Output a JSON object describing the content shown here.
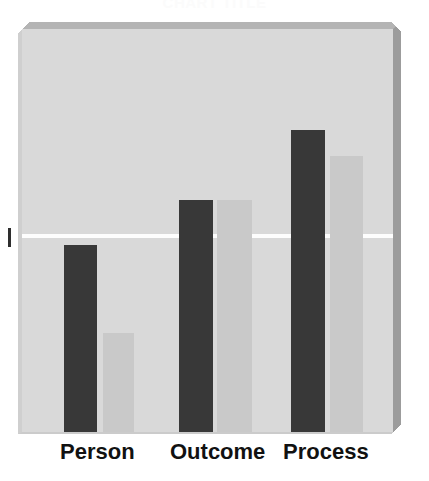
{
  "chart_data": {
    "type": "bar",
    "title": "",
    "xlabel": "",
    "ylabel": "",
    "categories": [
      "Person",
      "Outcome",
      "Process"
    ],
    "series": [
      {
        "name": "Series 1",
        "color": "#383838",
        "values": [
          46,
          57,
          74
        ]
      },
      {
        "name": "Series 2",
        "color": "#c9c9c9",
        "values": [
          24,
          57,
          68
        ]
      }
    ],
    "ylim": [
      0,
      100
    ],
    "grid": true,
    "gridlines": [
      50
    ],
    "legend": "none",
    "axis_tick_labels": [
      ""
    ]
  },
  "title": {
    "text": "CHART TITLE",
    "clipped": true
  },
  "axis": {
    "tick_mark": "y-axis-tick"
  },
  "colors": {
    "background": "#ffffff",
    "panel_fill": "#d9d9d9",
    "panel_bevel_top": "#b4b4b4",
    "panel_bevel_right": "#9c9c9c",
    "gridline": "#fdfdfd",
    "series_a": "#383838",
    "series_b": "#c9c9c9",
    "label_text": "#111111"
  },
  "geometry": {
    "gridline_top_px": 205,
    "bars": [
      {
        "category": "Person",
        "series": "Series 1",
        "left": 42,
        "width": 33,
        "top": 216
      },
      {
        "category": "Person",
        "series": "Series 2",
        "left": 81,
        "width": 31,
        "top": 304
      },
      {
        "category": "Outcome",
        "series": "Series 1",
        "left": 157,
        "width": 34,
        "top": 171
      },
      {
        "category": "Outcome",
        "series": "Series 2",
        "left": 195,
        "width": 35,
        "top": 171
      },
      {
        "category": "Process",
        "series": "Series 1",
        "left": 269,
        "width": 34,
        "top": 101
      },
      {
        "category": "Process",
        "series": "Series 2",
        "left": 308,
        "width": 33,
        "top": 127
      }
    ],
    "labels": [
      {
        "text": "Person",
        "left": 60
      },
      {
        "text": "Outcome",
        "left": 170
      },
      {
        "text": "Process",
        "left": 283
      }
    ]
  }
}
